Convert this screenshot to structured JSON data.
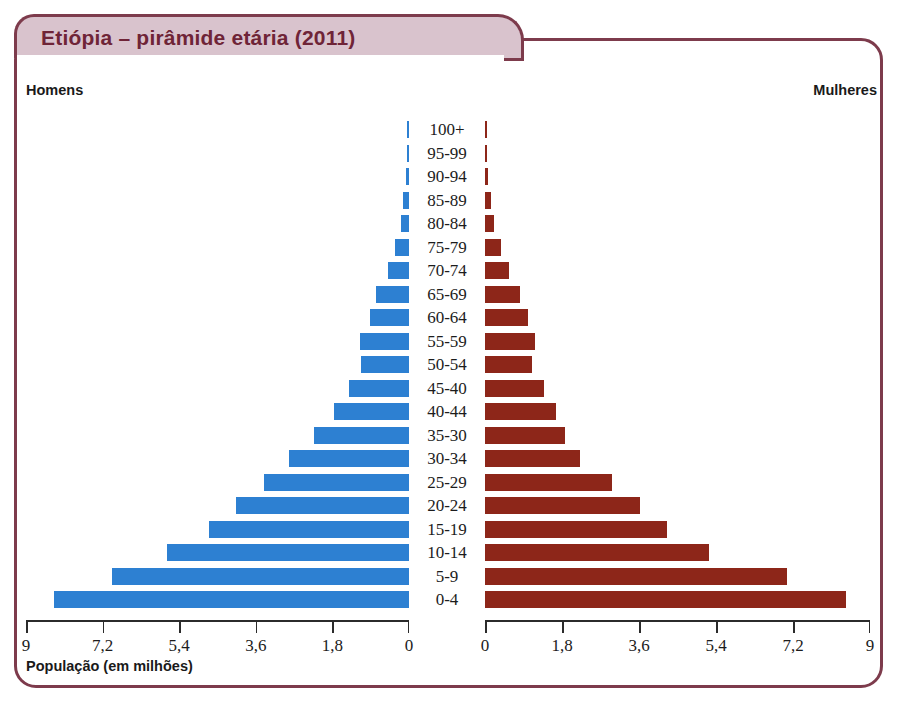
{
  "header": {
    "title": "Etiópia – pirâmide etária (2011)"
  },
  "labels": {
    "left_caption": "Homens",
    "right_caption": "Mulheres",
    "axis_caption": "População (em milhões)"
  },
  "colors": {
    "male_bar": "#2d80d2",
    "female_bar": "#8d2619",
    "frame_border": "#7d3b4c",
    "title_fill": "#d9c3cd",
    "title_text": "#6f2437"
  },
  "chart_data": {
    "type": "bar",
    "subtype": "population-pyramid",
    "title": "Etiópia – pirâmide etária (2011)",
    "xlabel": "População (em milhões)",
    "ylabel": "",
    "grid": false,
    "legend_position": "top-corners",
    "xlim": [
      0,
      9
    ],
    "xticks": [
      0,
      1.8,
      3.6,
      5.4,
      7.2,
      9
    ],
    "xticklabels_left": [
      "9",
      "7,2",
      "5,4",
      "3,6",
      "1,8",
      "0"
    ],
    "xticklabels_right": [
      "0",
      "1,8",
      "3,6",
      "5,4",
      "7,2",
      "9"
    ],
    "categories": [
      "100+",
      "95-99",
      "90-94",
      "85-89",
      "80-84",
      "75-79",
      "70-74",
      "65-69",
      "60-64",
      "55-59",
      "50-54",
      "45-40",
      "40-44",
      "35-30",
      "30-34",
      "25-29",
      "20-24",
      "15-19",
      "10-14",
      "5-9",
      "0-4"
    ],
    "series": [
      {
        "name": "Homens",
        "color": "#2d80d2",
        "side": "left",
        "values": [
          0.05,
          0.05,
          0.06,
          0.13,
          0.19,
          0.33,
          0.5,
          0.78,
          0.92,
          1.15,
          1.13,
          1.41,
          1.76,
          2.23,
          2.82,
          3.41,
          4.07,
          4.7,
          5.68,
          6.97,
          8.35
        ]
      },
      {
        "name": "Mulheres",
        "color": "#8d2619",
        "side": "right",
        "values": [
          0.05,
          0.05,
          0.06,
          0.15,
          0.22,
          0.38,
          0.56,
          0.82,
          1.0,
          1.17,
          1.1,
          1.37,
          1.66,
          1.88,
          2.22,
          2.97,
          3.63,
          4.26,
          5.23,
          7.07,
          8.44
        ]
      }
    ]
  }
}
